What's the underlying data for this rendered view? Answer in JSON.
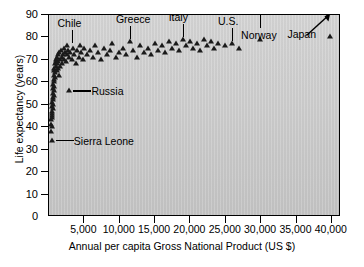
{
  "chart_data": {
    "type": "scatter",
    "title": "",
    "xlabel": "Annual per capita Gross National Product (US $)",
    "ylabel": "Life expectancy (years)",
    "xlim": [
      0,
      41500
    ],
    "ylim": [
      0,
      90
    ],
    "xticks": [
      0,
      5000,
      10000,
      15000,
      20000,
      25000,
      30000,
      35000,
      40000
    ],
    "xticklabels": [
      "0",
      "5,000",
      "10,000",
      "15,000",
      "20,000",
      "25,000",
      "30,000",
      "35,000",
      "40,000"
    ],
    "yticks": [
      0,
      10,
      20,
      30,
      40,
      50,
      60,
      70,
      80,
      90
    ],
    "yticklabels": [
      "0",
      "10",
      "20",
      "30",
      "40",
      "50",
      "60",
      "70",
      "80",
      "90"
    ],
    "grid": false,
    "legend": null,
    "marker": "triangle",
    "marker_color": "#1a1a1a",
    "plot_background": "#d0d0d0",
    "points": [
      [
        300,
        38
      ],
      [
        320,
        41
      ],
      [
        340,
        43
      ],
      [
        360,
        45
      ],
      [
        380,
        40
      ],
      [
        400,
        47
      ],
      [
        420,
        44
      ],
      [
        440,
        49
      ],
      [
        460,
        51
      ],
      [
        480,
        46
      ],
      [
        500,
        53
      ],
      [
        520,
        48
      ],
      [
        540,
        55
      ],
      [
        560,
        50
      ],
      [
        580,
        57
      ],
      [
        600,
        52
      ],
      [
        620,
        59
      ],
      [
        640,
        54
      ],
      [
        660,
        61
      ],
      [
        680,
        56
      ],
      [
        700,
        63
      ],
      [
        720,
        58
      ],
      [
        740,
        65
      ],
      [
        760,
        60
      ],
      [
        780,
        66
      ],
      [
        800,
        62
      ],
      [
        850,
        68
      ],
      [
        900,
        64
      ],
      [
        950,
        69
      ],
      [
        1000,
        67
      ],
      [
        1050,
        70
      ],
      [
        1100,
        65
      ],
      [
        1150,
        71
      ],
      [
        1200,
        68
      ],
      [
        1250,
        66
      ],
      [
        1300,
        72
      ],
      [
        1350,
        69
      ],
      [
        1400,
        63
      ],
      [
        1450,
        73
      ],
      [
        1500,
        70
      ],
      [
        1600,
        67
      ],
      [
        1700,
        74
      ],
      [
        1800,
        71
      ],
      [
        1900,
        68
      ],
      [
        2000,
        72
      ],
      [
        2100,
        75
      ],
      [
        2200,
        70
      ],
      [
        2300,
        73
      ],
      [
        2400,
        69
      ],
      [
        2500,
        76
      ],
      [
        2600,
        72
      ],
      [
        2700,
        74
      ],
      [
        2800,
        71
      ],
      [
        2900,
        56
      ],
      [
        3000,
        73
      ],
      [
        3200,
        70
      ],
      [
        3400,
        75
      ],
      [
        3600,
        72
      ],
      [
        3800,
        68
      ],
      [
        4000,
        74
      ],
      [
        4200,
        71
      ],
      [
        4400,
        76
      ],
      [
        4600,
        73
      ],
      [
        4800,
        70
      ],
      [
        5000,
        75
      ],
      [
        5400,
        72
      ],
      [
        5800,
        74
      ],
      [
        6200,
        71
      ],
      [
        6600,
        76
      ],
      [
        7000,
        73
      ],
      [
        7400,
        70
      ],
      [
        7800,
        75
      ],
      [
        8200,
        72
      ],
      [
        8600,
        74
      ],
      [
        9000,
        77
      ],
      [
        9500,
        71
      ],
      [
        10000,
        73
      ],
      [
        10500,
        75
      ],
      [
        11000,
        72
      ],
      [
        11500,
        78
      ],
      [
        12000,
        74
      ],
      [
        12500,
        71
      ],
      [
        13000,
        76
      ],
      [
        13500,
        73
      ],
      [
        14000,
        75
      ],
      [
        14500,
        72
      ],
      [
        15000,
        77
      ],
      [
        15500,
        74
      ],
      [
        16000,
        76
      ],
      [
        16500,
        73
      ],
      [
        17000,
        78
      ],
      [
        17500,
        75
      ],
      [
        18000,
        77
      ],
      [
        18500,
        74
      ],
      [
        19000,
        79
      ],
      [
        19500,
        76
      ],
      [
        20000,
        78
      ],
      [
        20500,
        75
      ],
      [
        21000,
        77
      ],
      [
        21500,
        74
      ],
      [
        22000,
        79
      ],
      [
        22500,
        76
      ],
      [
        23000,
        78
      ],
      [
        23500,
        75
      ],
      [
        24000,
        77
      ],
      [
        25000,
        76
      ],
      [
        26000,
        77
      ],
      [
        27000,
        75
      ],
      [
        30000,
        79
      ],
      [
        40000,
        80
      ],
      [
        400,
        34
      ]
    ],
    "annotations": [
      {
        "label": "Chile",
        "kind": "leader-down",
        "x": 3200,
        "y": 76
      },
      {
        "label": "Greece",
        "kind": "leader-down",
        "x": 11500,
        "y": 78
      },
      {
        "label": "Italy",
        "kind": "leader-down",
        "x": 19000,
        "y": 79
      },
      {
        "label": "U.S.",
        "kind": "leader-down",
        "x": 26000,
        "y": 77
      },
      {
        "label": "Russia",
        "kind": "leader-left",
        "x": 2900,
        "y": 56
      },
      {
        "label": "Sierra Leone",
        "kind": "leader-left",
        "x": 400,
        "y": 34
      },
      {
        "label": "Norway",
        "kind": "arrow-up",
        "x": 30000,
        "y": 79
      },
      {
        "label": "Japan",
        "kind": "arrow-diag",
        "x": 40000,
        "y": 80
      }
    ]
  }
}
